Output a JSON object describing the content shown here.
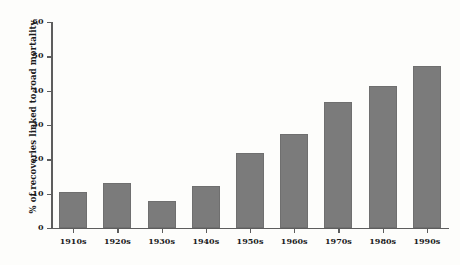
{
  "chart_data": {
    "type": "bar",
    "title": "",
    "xlabel": "",
    "ylabel": "% of recoveries linked to road mortality",
    "categories": [
      "1910s",
      "1920s",
      "1930s",
      "1940s",
      "1950s",
      "1960s",
      "1970s",
      "1980s",
      "1990s"
    ],
    "values": [
      10.5,
      13.1,
      7.9,
      12.2,
      21.9,
      27.4,
      36.7,
      41.4,
      47.2
    ],
    "ylim": [
      0,
      60
    ],
    "yticks": [
      0,
      10,
      20,
      30,
      40,
      50,
      60
    ],
    "ytick_labels": [
      "0",
      "10",
      "20",
      "30",
      "40",
      "50",
      "60"
    ],
    "grid": false,
    "legend": "none",
    "bar_color": "#7b7b7b",
    "axis_color": "#5d5d5d",
    "background_color": "#fdfdfb"
  }
}
